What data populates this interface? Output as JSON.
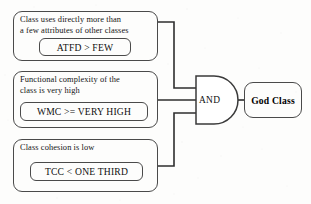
{
  "diagram": {
    "type": "logic-gate-diagram",
    "stroke_color": "#4a4a4a",
    "text_color": "#141414",
    "background_color": "#fdfdfc",
    "conditions": [
      {
        "id": "atfd",
        "description_lines": [
          "Class uses directly more than",
          "a few attributes of other classes"
        ],
        "metric": "ATFD > FEW"
      },
      {
        "id": "wmc",
        "description_lines": [
          "Functional complexity of the",
          "class is very high"
        ],
        "metric": "WMC >= VERY HIGH"
      },
      {
        "id": "tcc",
        "description_lines": [
          "Class cohesion is low"
        ],
        "metric": "TCC < ONE THIRD"
      }
    ],
    "gate": {
      "label": "AND",
      "kind": "and-gate",
      "inputs": 3
    },
    "output": {
      "label": "God Class"
    }
  }
}
